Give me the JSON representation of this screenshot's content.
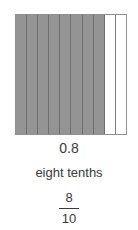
{
  "model": {
    "total_parts": 10,
    "shaded_parts": 8,
    "shaded_color": "#949494",
    "unshaded_color": "#ffffff",
    "border_color": "#8f8f8f",
    "orientation": "vertical-strips"
  },
  "labels": {
    "decimal": "0.8",
    "words": "eight tenths",
    "fraction_numerator": "8",
    "fraction_denominator": "10"
  },
  "chart_data": {
    "type": "bar",
    "title": "",
    "subtitle": "",
    "xlabel": "",
    "ylabel": "",
    "categories": [
      "1",
      "2",
      "3",
      "4",
      "5",
      "6",
      "7",
      "8",
      "9",
      "10"
    ],
    "values": [
      1,
      1,
      1,
      1,
      1,
      1,
      1,
      1,
      0,
      0
    ],
    "legend": [],
    "grid": true,
    "annotations": [
      "0.8",
      "eight tenths",
      "8/10"
    ]
  }
}
